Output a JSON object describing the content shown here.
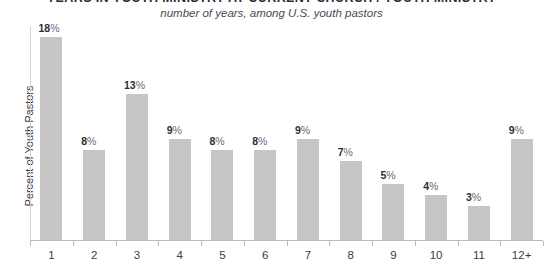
{
  "chart_data": {
    "type": "bar",
    "title": "YEARS IN YOUTH MINISTRY AT CURRENT CHURCH / YOUTH MINISTRY",
    "subtitle": "number of years, among U.S. youth pastors",
    "xlabel": "",
    "ylabel": "Percent of Youth Pastors",
    "categories": [
      "1",
      "2",
      "3",
      "4",
      "5",
      "6",
      "7",
      "8",
      "9",
      "10",
      "11",
      "12+"
    ],
    "values": [
      18,
      8,
      13,
      9,
      8,
      8,
      9,
      7,
      5,
      4,
      3,
      9
    ],
    "value_labels": [
      "18%",
      "8%",
      "13%",
      "9%",
      "8%",
      "8%",
      "9%",
      "7%",
      "5%",
      "4%",
      "3%",
      "9%"
    ],
    "ylim": [
      0,
      19
    ],
    "grid": false,
    "legend": null,
    "bar_color": "#c6c6c6",
    "text_color": "#2e2e36",
    "axis_color": "#bdbdbd",
    "background": "#ffffff"
  }
}
